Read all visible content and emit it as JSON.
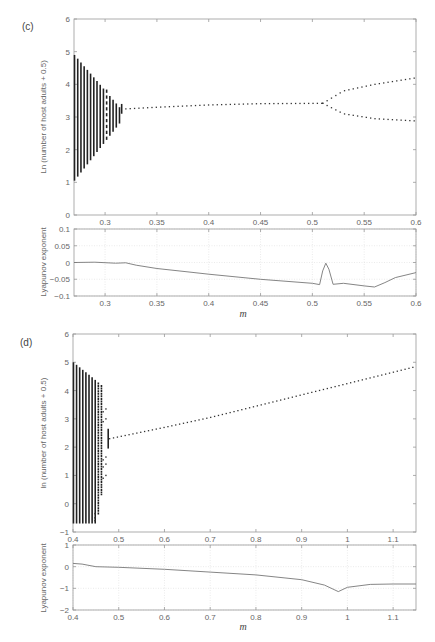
{
  "chart_data": [
    {
      "panel": "(c)",
      "type": "scatter",
      "title": "Bifurcation diagram",
      "xlabel": "m",
      "ylabel": "Ln (number of host adults + 0.5)",
      "xlim": [
        0.27,
        0.6
      ],
      "ylim": [
        0,
        6
      ],
      "xticks": [
        "0.3",
        "0.35",
        "0.4",
        "0.45",
        "0.5",
        "0.55",
        "0.6"
      ],
      "yticks": [
        "0",
        "1",
        "2",
        "3",
        "4",
        "5",
        "6"
      ],
      "grid": false,
      "chaotic_region": {
        "m_range": [
          0.27,
          0.32
        ],
        "upper_at_start": 4.9,
        "lower_at_start": 1.05
      },
      "stable_branch": {
        "m_range": [
          0.32,
          0.51
        ],
        "values": [
          [
            0.32,
            3.25
          ],
          [
            0.35,
            3.3
          ],
          [
            0.4,
            3.37
          ],
          [
            0.45,
            3.41
          ],
          [
            0.51,
            3.42
          ]
        ]
      },
      "period2_branches": [
        {
          "name": "upper",
          "values": [
            [
              0.51,
              3.42
            ],
            [
              0.53,
              3.8
            ],
            [
              0.56,
              4.0
            ],
            [
              0.6,
              4.2
            ]
          ]
        },
        {
          "name": "lower",
          "values": [
            [
              0.51,
              3.42
            ],
            [
              0.53,
              3.1
            ],
            [
              0.56,
              2.95
            ],
            [
              0.6,
              2.88
            ]
          ]
        }
      ]
    },
    {
      "panel": "(c)",
      "type": "line",
      "xlabel": "m",
      "ylabel": "Lyapunov exponent",
      "xlim": [
        0.27,
        0.6
      ],
      "ylim": [
        -0.1,
        0.1
      ],
      "xticks": [
        "0.3",
        "0.35",
        "0.4",
        "0.45",
        "0.5",
        "0.55",
        "0.6"
      ],
      "yticks": [
        "0.1",
        "0.05",
        "0",
        "-0.05",
        "-0.1"
      ],
      "grid": true,
      "x": [
        0.27,
        0.29,
        0.31,
        0.32,
        0.33,
        0.35,
        0.38,
        0.4,
        0.45,
        0.5,
        0.507,
        0.51,
        0.513,
        0.516,
        0.52,
        0.53,
        0.55,
        0.56,
        0.57,
        0.58,
        0.6
      ],
      "y": [
        0.0,
        0.001,
        -0.002,
        -0.001,
        -0.008,
        -0.018,
        -0.028,
        -0.035,
        -0.05,
        -0.062,
        -0.066,
        -0.025,
        -0.002,
        -0.02,
        -0.065,
        -0.062,
        -0.07,
        -0.073,
        -0.06,
        -0.045,
        -0.03
      ]
    },
    {
      "panel": "(d)",
      "type": "scatter",
      "title": "Bifurcation diagram",
      "xlabel": "m",
      "ylabel": "ln (number of host adults + 0.5)",
      "xlim": [
        0.4,
        1.15
      ],
      "ylim": [
        -1,
        6
      ],
      "xticks": [
        "0.4",
        "0.5",
        "0.6",
        "0.7",
        "0.8",
        "0.9",
        "1",
        "1.1"
      ],
      "yticks": [
        "-1",
        "0",
        "1",
        "2",
        "3",
        "4",
        "5",
        "6"
      ],
      "grid": false,
      "chaotic_region": {
        "m_range": [
          0.4,
          0.47
        ],
        "upper_at_start": 5.0,
        "lower_at_start": -0.7
      },
      "stable_branch": {
        "m_range": [
          0.48,
          1.15
        ],
        "values": [
          [
            0.48,
            2.3
          ],
          [
            0.6,
            2.7
          ],
          [
            0.7,
            3.05
          ],
          [
            0.8,
            3.45
          ],
          [
            0.9,
            3.85
          ],
          [
            1.0,
            4.25
          ],
          [
            1.1,
            4.65
          ],
          [
            1.15,
            4.85
          ]
        ]
      }
    },
    {
      "panel": "(d)",
      "type": "line",
      "xlabel": "m",
      "ylabel": "Lyapunov exponent",
      "xlim": [
        0.4,
        1.15
      ],
      "ylim": [
        -2,
        1
      ],
      "xticks": [
        "0.4",
        "0.5",
        "0.6",
        "0.7",
        "0.8",
        "0.9",
        "1",
        "1.1"
      ],
      "yticks": [
        "1",
        "0",
        "-1",
        "-2"
      ],
      "grid": true,
      "x": [
        0.4,
        0.42,
        0.45,
        0.5,
        0.6,
        0.7,
        0.8,
        0.9,
        0.95,
        0.98,
        1.0,
        1.05,
        1.1,
        1.15
      ],
      "y": [
        0.15,
        0.12,
        0.0,
        -0.03,
        -0.12,
        -0.25,
        -0.38,
        -0.6,
        -0.85,
        -1.15,
        -0.95,
        -0.82,
        -0.8,
        -0.8
      ]
    }
  ],
  "labels": {
    "panel_c": "(c)",
    "panel_d": "(d)",
    "c_main_ylabel": "Ln (number of host adults + 0.5)",
    "d_main_ylabel": "ln (number of host adults + 0.5)",
    "lyap_ylabel": "Lyapunov exponent",
    "xlabel": "m"
  }
}
